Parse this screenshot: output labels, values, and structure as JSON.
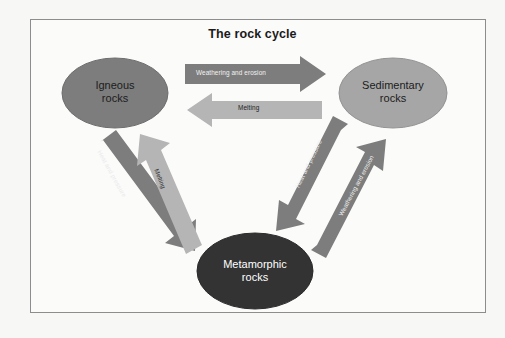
{
  "page": {
    "title": "The rock cycle",
    "background_color": "#f7f7f5",
    "panel_color": "#fbfbfa",
    "border_color": "#8d8d8d"
  },
  "nodes": [
    {
      "id": "igneous",
      "line1": "Igneous",
      "line2": "rocks",
      "fill": "#7d7d7d",
      "stroke": "#6a6a6a",
      "text_color": "#1c1c1c",
      "cx": 115,
      "cy": 93,
      "rx": 53,
      "ry": 35
    },
    {
      "id": "sedimentary",
      "line1": "Sedimentary",
      "line2": "rocks",
      "fill": "#a6a6a6",
      "stroke": "#8f8f8f",
      "text_color": "#1c1c1c",
      "cx": 393,
      "cy": 93,
      "rx": 54,
      "ry": 35
    },
    {
      "id": "metamorphic",
      "line1": "Metamorphic",
      "line2": "rocks",
      "fill": "#333333",
      "stroke": "#2b2b2b",
      "text_color": "#ffffff",
      "cx": 255,
      "cy": 271,
      "rx": 58,
      "ry": 38
    }
  ],
  "arrows": [
    {
      "id": "igneous-to-sedimentary",
      "label": "Weathering and erosion",
      "fill": "#7d7d7d",
      "direction": "right",
      "label_color": "#f2f2f2"
    },
    {
      "id": "sedimentary-to-igneous",
      "label": "Melting",
      "fill": "#b5b5b5",
      "direction": "left",
      "label_color": "#232323"
    },
    {
      "id": "igneous-to-metamorphic",
      "label": "Heat and pressure",
      "fill": "#7d7d7d",
      "direction": "down-right",
      "label_color": "#eaeaea"
    },
    {
      "id": "metamorphic-to-igneous",
      "label": "Melting",
      "fill": "#b5b5b5",
      "direction": "up-left",
      "label_color": "#2a2a2a"
    },
    {
      "id": "sedimentary-to-metamorphic",
      "label": "Heat and pressure",
      "fill": "#7d7d7d",
      "direction": "down-left",
      "label_color": "#ededed"
    },
    {
      "id": "metamorphic-to-sedimentary",
      "label": "Weathering and erosion",
      "fill": "#7d7d7d",
      "direction": "up-right",
      "label_color": "#ededed"
    }
  ]
}
